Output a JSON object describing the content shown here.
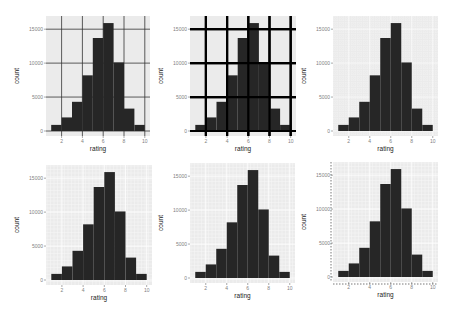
{
  "chart_data": {
    "type": "bar",
    "layout": "2x3 grid of histograms",
    "shared": {
      "xlabel": "rating",
      "ylabel": "count",
      "x_ticks": [
        2,
        4,
        6,
        8,
        10
      ],
      "y_ticks": [
        0,
        5000,
        10000,
        15000
      ],
      "y_tick_labels": [
        "0",
        "5000",
        "10000",
        "15000"
      ],
      "x_range": [
        0.5,
        10.5
      ],
      "y_range": [
        0,
        16500
      ],
      "bins": [
        {
          "x0": 1,
          "x1": 2,
          "count": 900
        },
        {
          "x0": 2,
          "x1": 3,
          "count": 2000
        },
        {
          "x0": 3,
          "x1": 4,
          "count": 4300
        },
        {
          "x0": 4,
          "x1": 5,
          "count": 8200
        },
        {
          "x0": 5,
          "x1": 6,
          "count": 13700
        },
        {
          "x0": 6,
          "x1": 7,
          "count": 15900
        },
        {
          "x0": 7,
          "x1": 8,
          "count": 10100
        },
        {
          "x0": 8,
          "x1": 9,
          "count": 3300
        },
        {
          "x0": 9,
          "x1": 10,
          "count": 900
        }
      ],
      "bar_color": "#262626",
      "panel_bg": "#ebebeb"
    },
    "panels": [
      {
        "id": 1,
        "grid_style": "dark-thin-major",
        "box": [
          46,
          16,
          104,
          120
        ]
      },
      {
        "id": 2,
        "grid_style": "black-thick-major",
        "box": [
          190,
          16,
          106,
          120
        ]
      },
      {
        "id": 3,
        "grid_style": "dotted-fine",
        "box": [
          333,
          16,
          105,
          120
        ]
      },
      {
        "id": 4,
        "grid_style": "white-fine",
        "box": [
          46,
          165,
          106,
          120
        ]
      },
      {
        "id": 5,
        "grid_style": "white-fine",
        "box": [
          190,
          163,
          105,
          120
        ]
      },
      {
        "id": 6,
        "grid_style": "white-fine-dashed-axis",
        "box": [
          333,
          162,
          105,
          120
        ]
      }
    ]
  }
}
